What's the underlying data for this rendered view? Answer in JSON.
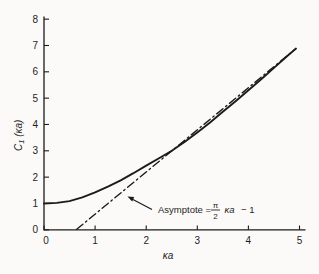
{
  "figure": {
    "background": "#fbfaf8",
    "line_color": "#1b1b1b",
    "text_color": "#1f1f1f"
  },
  "chart_data": {
    "type": "line",
    "title": "",
    "xlabel": "κa",
    "ylabel": "C₁ (κa)",
    "ylabel_parts": {
      "main": "C",
      "sub": "1",
      "rest": " (κa)"
    },
    "xlim": [
      0,
      5
    ],
    "ylim": [
      0,
      8
    ],
    "x_ticks": [
      0,
      1,
      2,
      3,
      4,
      5
    ],
    "y_ticks": [
      0,
      1,
      2,
      3,
      4,
      5,
      6,
      7,
      8
    ],
    "grid": false,
    "legend": "none",
    "series": [
      {
        "name": "C1(κa) curve",
        "style": "solid",
        "x": [
          0,
          0.25,
          0.5,
          0.75,
          1.0,
          1.25,
          1.5,
          1.75,
          2.0,
          2.25,
          2.5,
          2.75,
          3.0,
          3.25,
          3.5,
          3.75,
          4.0,
          4.25,
          4.5,
          4.75,
          4.93
        ],
        "y": [
          1.0,
          1.02,
          1.09,
          1.23,
          1.42,
          1.64,
          1.88,
          2.15,
          2.44,
          2.72,
          3.0,
          3.33,
          3.7,
          4.08,
          4.48,
          4.88,
          5.3,
          5.72,
          6.15,
          6.58,
          6.88
        ]
      },
      {
        "name": "asymptote",
        "style": "dash-dot",
        "equation": "(π/2)κa − 1",
        "x": [
          0.64,
          4.93
        ],
        "y": [
          0.02,
          6.88
        ]
      }
    ],
    "annotation": {
      "text": "Asymptote = (π/2)κa − 1",
      "prefix": "Asymptote =",
      "frac_num": "π",
      "frac_den": "2",
      "var": "κa",
      "tail": "− 1"
    }
  }
}
